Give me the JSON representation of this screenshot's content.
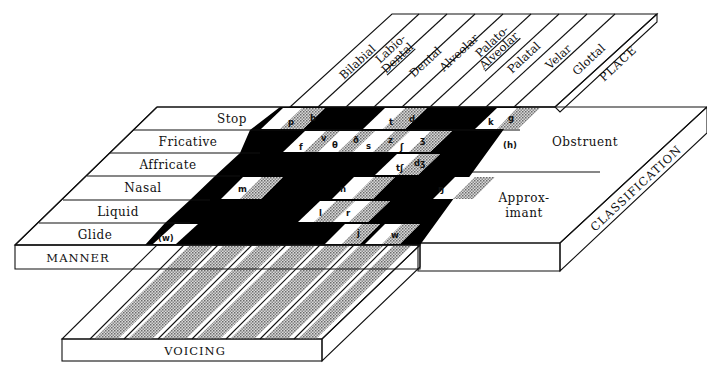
{
  "title_fragment": "( ... )",
  "place": {
    "axis_label": "PLACE",
    "columns": [
      {
        "label": "Bilabial"
      },
      {
        "label": "Labio-",
        "label2": "Dental"
      },
      {
        "label": "Dental"
      },
      {
        "label": "Alveolar"
      },
      {
        "label": "Palato-",
        "label2": "Alveolar"
      },
      {
        "label": "Palatal"
      },
      {
        "label": "Velar"
      },
      {
        "label": "Glottal"
      }
    ]
  },
  "manner": {
    "axis_label": "MANNER",
    "rows": [
      {
        "label": "Stop"
      },
      {
        "label": "Fricative"
      },
      {
        "label": "Affricate"
      },
      {
        "label": "Nasal"
      },
      {
        "label": "Liquid"
      },
      {
        "label": "Glide"
      }
    ]
  },
  "classification": {
    "axis_label": "CLASSIFICATION",
    "groups": [
      {
        "label": "Obstruent"
      },
      {
        "label": "Approx-",
        "label2": "imant"
      }
    ]
  },
  "voicing": {
    "axis_label": "VOICING"
  },
  "symbols": {
    "stop": [
      "p",
      "b",
      "t",
      "d",
      "k",
      "g"
    ],
    "fricative": [
      "f",
      "v",
      "θ",
      "ð",
      "s",
      "z",
      "ʃ",
      "ʒ",
      "(h)"
    ],
    "affricate": [
      "tʃ",
      "dʒ"
    ],
    "nasal": [
      "m",
      "n",
      "ŋ"
    ],
    "liquid": [
      "l",
      "r"
    ],
    "glide": [
      "(w)",
      "j",
      "w"
    ]
  },
  "colors": {
    "ink": "#111111",
    "paper": "#ffffff",
    "voiced_shade": "#a8a8a8",
    "voicing_board": "#b5b5b5"
  }
}
